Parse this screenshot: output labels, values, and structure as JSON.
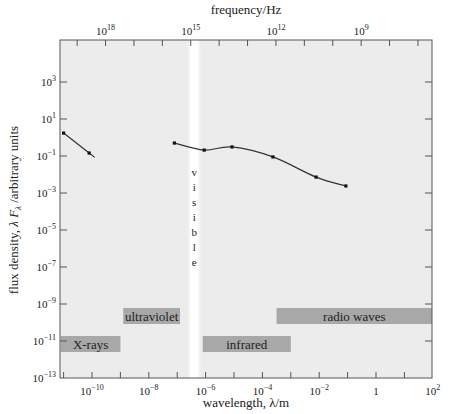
{
  "chart_data": {
    "type": "line",
    "title": "",
    "xlabel": "wavelength, λ/m",
    "ylabel": "flux density, λ F_λ /arbitrary units",
    "top_axis_label": "frequency/Hz",
    "x_scale": "log",
    "y_scale": "log",
    "xlim_log10": [
      -11.1,
      2
    ],
    "ylim_log10": [
      -13,
      5.3
    ],
    "x_ticks": [
      {
        "log": -10,
        "base": "10",
        "exp": "−10"
      },
      {
        "log": -8,
        "base": "10",
        "exp": "−8"
      },
      {
        "log": -6,
        "base": "10",
        "exp": "−6"
      },
      {
        "log": -4,
        "base": "10",
        "exp": "−4"
      },
      {
        "log": -2,
        "base": "10",
        "exp": "−2"
      },
      {
        "log": 0,
        "base": "1",
        "exp": ""
      },
      {
        "log": 2,
        "base": "10",
        "exp": "2"
      }
    ],
    "y_ticks": [
      {
        "log": 3,
        "base": "10",
        "exp": "3"
      },
      {
        "log": 1,
        "base": "10",
        "exp": "1"
      },
      {
        "log": -1,
        "base": "10",
        "exp": "−1"
      },
      {
        "log": -3,
        "base": "10",
        "exp": "−3"
      },
      {
        "log": -5,
        "base": "10",
        "exp": "−5"
      },
      {
        "log": -7,
        "base": "10",
        "exp": "−7"
      },
      {
        "log": -9,
        "base": "10",
        "exp": "−9"
      },
      {
        "log": -11,
        "base": "10",
        "exp": "−11"
      },
      {
        "log": -13,
        "base": "10",
        "exp": "−13"
      }
    ],
    "top_ticks": [
      {
        "freq_log": 18,
        "base": "10",
        "exp": "18"
      },
      {
        "freq_log": 15,
        "base": "10",
        "exp": "15"
      },
      {
        "freq_log": 12,
        "base": "10",
        "exp": "12"
      },
      {
        "freq_log": 9,
        "base": "10",
        "exp": "9"
      }
    ],
    "series": [
      {
        "name": "X-ray segment",
        "log_wavelength": [
          -11.0,
          -10.1
        ],
        "log_flux": [
          0.24,
          -0.84
        ],
        "values": [
          1.7,
          0.14
        ]
      },
      {
        "name": "UV-optical-IR-radio segment",
        "log_wavelength": [
          -7.1,
          -6.05,
          -5.07,
          -3.63,
          -2.11,
          -1.06
        ],
        "log_flux": [
          -0.3,
          -0.68,
          -0.51,
          -1.05,
          -2.14,
          -2.62
        ],
        "values": [
          0.5,
          0.21,
          0.31,
          0.09,
          0.0072,
          0.0024
        ]
      }
    ],
    "bands": [
      {
        "label": "X-rays",
        "from_log": -11.1,
        "to_log": -9.0,
        "row": 1
      },
      {
        "label": "ultraviolet",
        "from_log": -8.9,
        "to_log": -6.9,
        "row": 0
      },
      {
        "label": "infrared",
        "from_log": -6.1,
        "to_log": -3.0,
        "row": 1
      },
      {
        "label": "radio waves",
        "from_log": -3.5,
        "to_log": 2,
        "row": 0
      }
    ],
    "visible_band": {
      "label": "visible",
      "letters": [
        "v",
        "i",
        "s",
        "i",
        "b",
        "l",
        "e"
      ],
      "log_wavelength": -6.4
    },
    "grid": false,
    "legend": "none",
    "colors": {
      "plot_bg": "#ececec",
      "band_fill": "#a8a8a8",
      "visible_strip": "#ffffff",
      "line": "#333333",
      "marker": "#111111"
    }
  }
}
